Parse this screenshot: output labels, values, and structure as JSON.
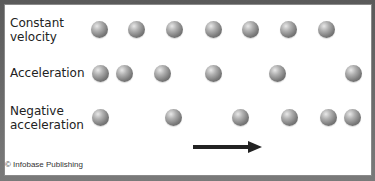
{
  "rows": [
    {
      "label": "Constant\nvelocity",
      "positions": [
        99,
        136,
        174,
        213,
        250,
        288,
        326
      ]
    },
    {
      "label": "Acceleration",
      "positions": [
        100,
        124,
        162,
        213,
        277,
        353
      ]
    },
    {
      "label": "Negative\nacceleration",
      "positions": [
        100,
        173,
        240,
        289,
        328,
        352
      ]
    }
  ],
  "arrow": {
    "direction": "right",
    "meaning": "direction-of-motion"
  },
  "credit": "© Infobase Publishing",
  "colors": {
    "ball": "#8a8a8a",
    "arrow": "#222222",
    "background": "#ffffff"
  }
}
